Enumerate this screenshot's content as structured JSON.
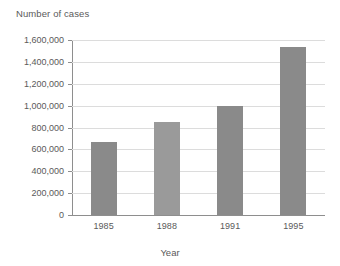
{
  "chart_data": {
    "type": "bar",
    "title": "Number of cases",
    "xlabel": "Year",
    "ylabel": "Number of cases",
    "categories": [
      "1985",
      "1988",
      "1991",
      "1995"
    ],
    "values": [
      667000,
      850000,
      1000000,
      1540000
    ],
    "ylim": [
      0,
      1600000
    ],
    "ytick_step": 200000,
    "ytick_labels": [
      "1,600,000",
      "1,400,000",
      "1,200,000",
      "1,000,000",
      "800,000",
      "600,000",
      "400,000",
      "200,000",
      "0"
    ],
    "ytick_values": [
      1600000,
      1400000,
      1200000,
      1000000,
      800000,
      600000,
      400000,
      200000,
      0
    ],
    "grid": true,
    "legend": false,
    "bar_colors": [
      "#8a8a8a",
      "#9a9a9a",
      "#8a8a8a",
      "#8a8a8a"
    ],
    "colors": {
      "gridline": "#dcdcdc",
      "axis": "#8e8e8e",
      "text": "#5a5a5a",
      "background": "#ffffff",
      "bar_default": "#8a8a8a"
    }
  }
}
